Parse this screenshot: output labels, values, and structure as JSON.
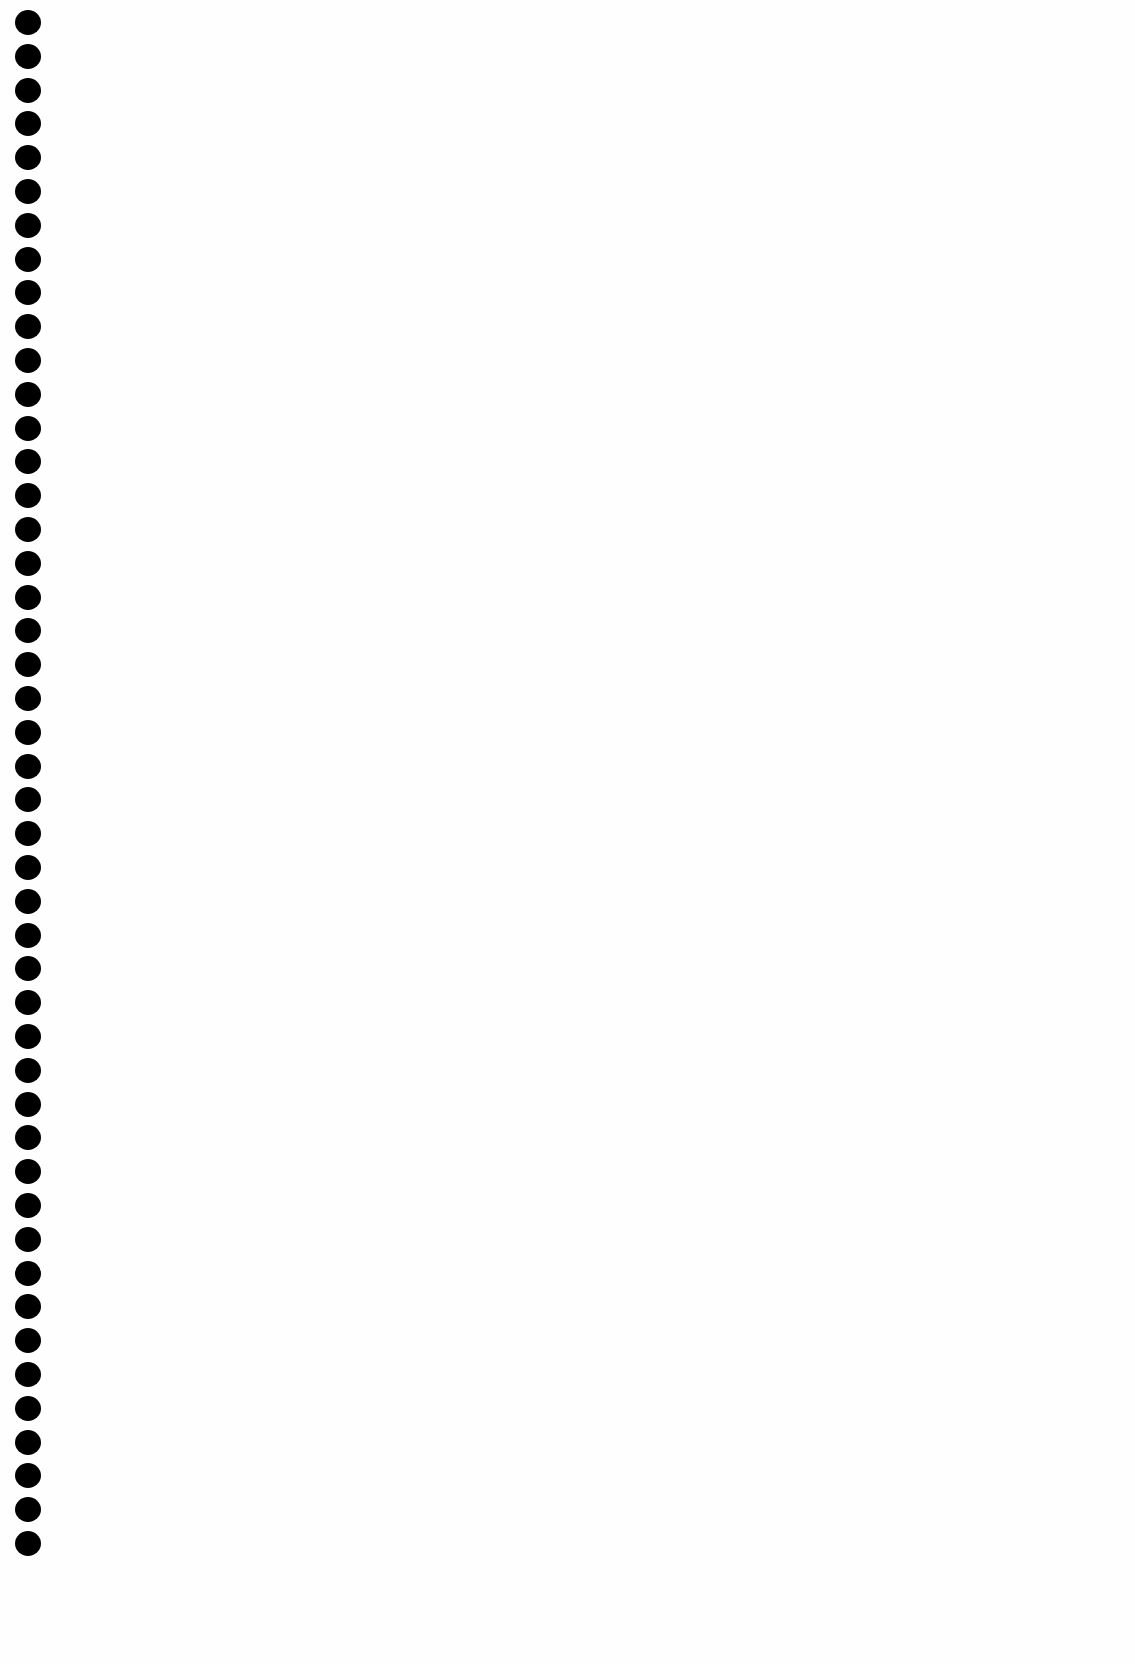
{
  "page": {
    "type": "blank-notebook-page",
    "background_color": "#fefefe",
    "content": ""
  },
  "binding": {
    "hole_count": 46,
    "hole_color": "#000000",
    "first_hole_top": 10,
    "hole_spacing": 33.8
  }
}
